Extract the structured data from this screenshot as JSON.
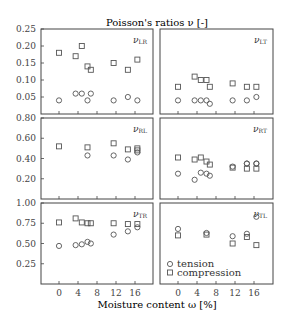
{
  "chart_data": {
    "type": "scatter",
    "title": "Poisson's ratios ν [-]",
    "xlabel": "Moisture content ω [%]",
    "x_ticks": [
      0,
      4,
      8,
      12,
      16
    ],
    "legend": [
      {
        "name": "tension",
        "marker": "circle"
      },
      {
        "name": "compression",
        "marker": "square"
      }
    ],
    "legend_position": "bottom-right panel, lower left",
    "panels": [
      {
        "id": "LR",
        "label": "ν",
        "sub": "LR",
        "row": 0,
        "col": 0,
        "ylim": [
          0,
          0.25
        ],
        "y_ticks": [
          "0.25",
          "0.20",
          "0.15",
          "0.10",
          "0.05"
        ],
        "series": [
          {
            "name": "compression",
            "x": [
              0,
              3.5,
              4.8,
              6,
              6.7,
              11.5,
              14.5,
              16.5
            ],
            "y": [
              0.18,
              0.17,
              0.2,
              0.14,
              0.13,
              0.15,
              0.13,
              0.16
            ]
          },
          {
            "name": "tension",
            "x": [
              0,
              3.5,
              4.8,
              6,
              6.7,
              11.5,
              14.5,
              16.5
            ],
            "y": [
              0.04,
              0.06,
              0.06,
              0.04,
              0.06,
              0.04,
              0.05,
              0.04
            ]
          }
        ]
      },
      {
        "id": "LT",
        "label": "ν",
        "sub": "LT",
        "row": 0,
        "col": 1,
        "ylim": [
          0,
          0.25
        ],
        "y_ticks": [],
        "series": [
          {
            "name": "compression",
            "x": [
              0,
              3.5,
              4.8,
              6,
              6.7,
              11.5,
              14.5,
              16.5
            ],
            "y": [
              0.08,
              0.11,
              0.1,
              0.1,
              0.08,
              0.09,
              0.08,
              0.08
            ]
          },
          {
            "name": "tension",
            "x": [
              0,
              3.5,
              4.8,
              6,
              6.7,
              11.5,
              14.5,
              16.5
            ],
            "y": [
              0.04,
              0.04,
              0.04,
              0.04,
              0.03,
              0.04,
              0.04,
              0.05
            ]
          }
        ]
      },
      {
        "id": "RL",
        "label": "ν",
        "sub": "RL",
        "row": 1,
        "col": 0,
        "ylim": [
          0,
          0.8
        ],
        "y_ticks": [
          "0.80",
          "0.60",
          "0.40",
          "0.20"
        ],
        "series": [
          {
            "name": "compression",
            "x": [
              0,
              6,
              11.5,
              14.5,
              16.5,
              16.5
            ],
            "y": [
              0.52,
              0.51,
              0.55,
              0.49,
              0.5,
              0.48
            ]
          },
          {
            "name": "tension",
            "x": [
              6,
              11.5,
              14.5,
              16.5
            ],
            "y": [
              0.43,
              0.43,
              0.39,
              0.46
            ]
          }
        ]
      },
      {
        "id": "RT",
        "label": "ν",
        "sub": "RT",
        "row": 1,
        "col": 1,
        "ylim": [
          0,
          0.8
        ],
        "y_ticks": [],
        "series": [
          {
            "name": "compression",
            "x": [
              0,
              3.5,
              4.8,
              6,
              6.7,
              11.5,
              14.5,
              16.5
            ],
            "y": [
              0.41,
              0.39,
              0.41,
              0.37,
              0.34,
              0.31,
              0.3,
              0.3
            ]
          },
          {
            "name": "tension",
            "x": [
              0,
              3.5,
              4.8,
              6,
              6.7,
              11.5,
              14.5,
              16.5,
              14.5,
              16.5
            ],
            "y": [
              0.25,
              0.19,
              0.26,
              0.25,
              0.23,
              0.32,
              0.35,
              0.35,
              0.35,
              0.35
            ]
          }
        ]
      },
      {
        "id": "TR",
        "label": "ν",
        "sub": "TR",
        "row": 2,
        "col": 0,
        "ylim": [
          0,
          1.0
        ],
        "y_ticks": [
          "1.00",
          "0.75",
          "0.50",
          "0.25"
        ],
        "series": [
          {
            "name": "compression",
            "x": [
              0,
              3.5,
              4.8,
              6,
              6.7,
              11.5,
              14.5,
              16.5
            ],
            "y": [
              0.76,
              0.81,
              0.76,
              0.75,
              0.75,
              0.75,
              0.74,
              0.74
            ]
          },
          {
            "name": "tension",
            "x": [
              0,
              3.5,
              4.8,
              6,
              6.7,
              11.5,
              14.5,
              16.5
            ],
            "y": [
              0.47,
              0.48,
              0.49,
              0.52,
              0.5,
              0.61,
              0.65,
              0.7
            ]
          }
        ]
      },
      {
        "id": "TL",
        "label": "ν",
        "sub": "TL",
        "row": 2,
        "col": 1,
        "ylim": [
          0,
          1.0
        ],
        "y_ticks": [],
        "series": [
          {
            "name": "compression",
            "x": [
              0,
              6,
              11.5,
              14.5,
              16.5
            ],
            "y": [
              0.6,
              0.61,
              0.5,
              0.58,
              0.48
            ]
          },
          {
            "name": "tension",
            "x": [
              0,
              6,
              11.5,
              14.5,
              16.5
            ],
            "y": [
              0.68,
              0.63,
              0.59,
              0.62,
              0.83
            ]
          }
        ]
      }
    ]
  },
  "labels": {
    "title": "Poisson's ratios ν [-]",
    "xlabel": "Moisture content ω [%]",
    "legend_tension": "tension",
    "legend_compression": "compression"
  }
}
